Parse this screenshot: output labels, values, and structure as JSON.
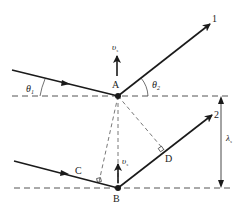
{
  "diagram": {
    "points": {
      "A": {
        "label": "A"
      },
      "B": {
        "label": "B"
      },
      "C": {
        "label": "C"
      },
      "D": {
        "label": "D"
      }
    },
    "rays": {
      "ray1": {
        "label": "1"
      },
      "ray2": {
        "label": "2"
      }
    },
    "angles": {
      "incident": {
        "symbol": "θ",
        "sub": "1"
      },
      "reflected": {
        "symbol": "θ",
        "sub": "2"
      }
    },
    "velocity": {
      "symbol": "υ",
      "sub": "s"
    },
    "spacing": {
      "symbol": "λ",
      "sub": "s"
    },
    "colors": {
      "line": "#1a1a1a",
      "dashed": "#555555",
      "background": "#ffffff"
    }
  }
}
